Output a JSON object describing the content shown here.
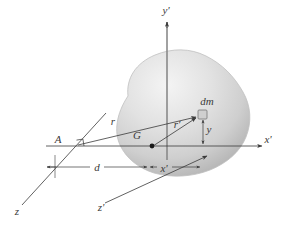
{
  "figure": {
    "background_color": "#ffffff",
    "line_color": "#3a3a3a",
    "body_fill_light": "#f2f2f2",
    "body_fill_mid": "#d6d6d6",
    "body_fill_dark": "#b4b4b4",
    "body_outline": "#c3c3c3",
    "element_fill": "#cfcfcf",
    "element_stroke": "#6a6a6a",
    "point_color": "#1a1a1a"
  },
  "axes": [
    {
      "id": "y-prime",
      "label": "y'",
      "label_x": 166,
      "label_y": 14
    },
    {
      "id": "x-prime",
      "label": "x'",
      "label_x": 268,
      "label_y": 143
    },
    {
      "id": "z-prime",
      "label": "z'",
      "label_x": 101,
      "label_y": 211
    },
    {
      "id": "z",
      "label": "z",
      "label_x": 17,
      "label_y": 215
    }
  ],
  "points": [
    {
      "id": "centroid",
      "label": "G",
      "label_x": 137,
      "label_y": 138,
      "dot_x": 152,
      "dot_y": 146
    },
    {
      "id": "reference",
      "label": "A",
      "label_x": 58,
      "label_y": 143,
      "dot_x": 77,
      "dot_y": 146
    }
  ],
  "mass_element": {
    "label": "dm",
    "label_x": 205,
    "label_y": 104,
    "x": 200,
    "y": 115,
    "size": 9
  },
  "dimensions": [
    {
      "id": "r-from-A",
      "label": "r",
      "label_x": 113,
      "label_y": 124
    },
    {
      "id": "r-prime",
      "label": "r'",
      "label_x": 176,
      "label_y": 127
    },
    {
      "id": "d-distance",
      "label": "d",
      "label_x": 96,
      "label_y": 170
    },
    {
      "id": "x-prime-dim",
      "label": "x'",
      "label_x": 162,
      "label_y": 172
    },
    {
      "id": "y-dim",
      "label": "y",
      "label_x": 209,
      "label_y": 131
    }
  ],
  "markers": {
    "right_angle": {
      "id": "right-angle-marker",
      "x": 80,
      "y": 140
    }
  }
}
